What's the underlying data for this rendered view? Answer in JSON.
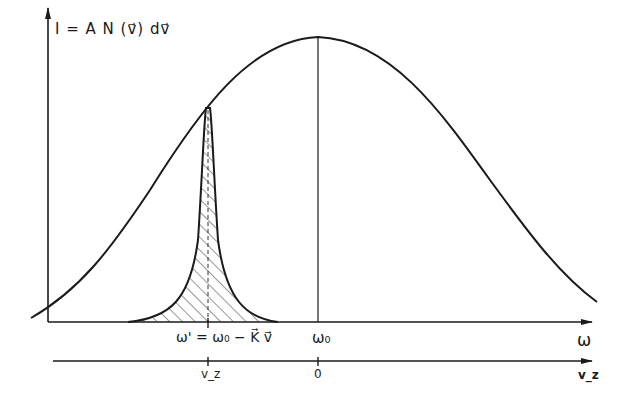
{
  "diagram": {
    "y_axis_label": "I = A N (v⃗) dv⃗",
    "x_axis_label": "ω",
    "x_axis_tick_labels": {
      "shifted": "ω' = ω₀ − K⃗ v⃗",
      "center": "ω₀"
    },
    "velocity_axis_label": "v_z",
    "velocity_axis_tick_labels": {
      "shifted": "v_z",
      "center": "0"
    },
    "colors": {
      "line": "#1a1a1a",
      "background": "#ffffff"
    }
  }
}
